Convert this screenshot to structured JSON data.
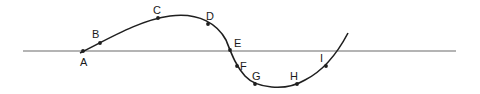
{
  "diagram": {
    "type": "wave-curve-with-labeled-points",
    "colors": {
      "axis": "#6b6b6b",
      "curve": "#1f1f1f",
      "point": "#1f1f1f",
      "label": "#1a1a1a"
    },
    "axis_line": {
      "x1": 23,
      "y1": 51,
      "x2": 456,
      "y2": 51
    },
    "curve_path": "M 80 53 C 110 38, 140 20, 170 16 C 200 12, 218 25, 226 40 C 232 55, 236 66, 245 76 C 256 88, 285 92, 305 80 C 325 70, 338 52, 348 33",
    "points": [
      {
        "label": "A",
        "x": 83,
        "y": 51,
        "lx": 80,
        "ly": 66
      },
      {
        "label": "B",
        "x": 100,
        "y": 43,
        "lx": 92,
        "ly": 38
      },
      {
        "label": "C",
        "x": 158,
        "y": 18,
        "lx": 153,
        "ly": 14
      },
      {
        "label": "D",
        "x": 208,
        "y": 24,
        "lx": 206,
        "ly": 20
      },
      {
        "label": "E",
        "x": 230,
        "y": 50,
        "lx": 234,
        "ly": 47
      },
      {
        "label": "F",
        "x": 237,
        "y": 66,
        "lx": 240,
        "ly": 70
      },
      {
        "label": "G",
        "x": 255,
        "y": 84,
        "lx": 252,
        "ly": 80
      },
      {
        "label": "H",
        "x": 297,
        "y": 84,
        "lx": 290,
        "ly": 80
      },
      {
        "label": "I",
        "x": 326,
        "y": 66,
        "lx": 320,
        "ly": 62
      }
    ]
  }
}
